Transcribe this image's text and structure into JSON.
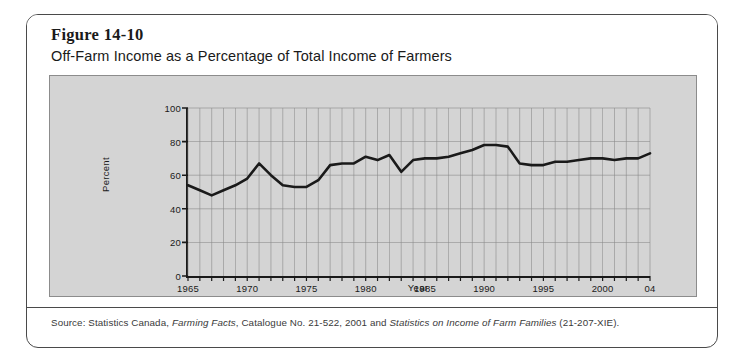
{
  "figure": {
    "number": "Figure 14-10",
    "title": "Off-Farm Income as a Percentage of Total Income of Farmers",
    "source_prefix": "Source: Statistics Canada, ",
    "source_italic_1": "Farming Facts",
    "source_middle": ", Catalogue No. 21-522, 2001 and ",
    "source_italic_2": "Statistics on Income of Farm Families",
    "source_suffix": " (21-207-XIE)."
  },
  "colors": {
    "panel_background": "#d4d4d4",
    "card_background": "#ffffff",
    "border": "#4a4a4a",
    "axis": "#1a1a1a",
    "grid": "#8a8a8a",
    "line": "#1a1a1a"
  },
  "chart_data": {
    "type": "line",
    "title": "Off-Farm Income as a Percentage of Total Income of Farmers",
    "xlabel": "Year",
    "ylabel": "Percent",
    "xlim": [
      1965,
      2004
    ],
    "ylim": [
      0,
      100
    ],
    "grid": true,
    "legend": "none",
    "y_ticks": [
      0,
      20,
      40,
      60,
      80,
      100
    ],
    "y_tick_labels": [
      "0",
      "20",
      "40",
      "60",
      "80",
      "100"
    ],
    "x_ticks": [
      1965,
      1970,
      1975,
      1980,
      1985,
      1990,
      1995,
      2000,
      2004
    ],
    "x_tick_labels": [
      "1965",
      "1970",
      "1975",
      "1980",
      "1985",
      "1990",
      "1995",
      "2000",
      "04"
    ],
    "x": [
      1965,
      1966,
      1967,
      1968,
      1969,
      1970,
      1971,
      1972,
      1973,
      1974,
      1975,
      1976,
      1977,
      1978,
      1979,
      1980,
      1981,
      1982,
      1983,
      1984,
      1985,
      1986,
      1987,
      1988,
      1989,
      1990,
      1991,
      1992,
      1993,
      1994,
      1995,
      1996,
      1997,
      1998,
      1999,
      2000,
      2001,
      2002,
      2003,
      2004
    ],
    "values": [
      54,
      51,
      48,
      51,
      54,
      58,
      67,
      60,
      54,
      53,
      53,
      57,
      66,
      67,
      67,
      71,
      69,
      72,
      62,
      69,
      70,
      70,
      71,
      73,
      75,
      78,
      78,
      77,
      67,
      66,
      66,
      68,
      68,
      69,
      70,
      70,
      69,
      70,
      70,
      73
    ],
    "series": [
      {
        "name": "Off-farm income as % of total income",
        "values": [
          54,
          51,
          48,
          51,
          54,
          58,
          67,
          60,
          54,
          53,
          53,
          57,
          66,
          67,
          67,
          71,
          69,
          72,
          62,
          69,
          70,
          70,
          71,
          73,
          75,
          78,
          78,
          77,
          67,
          66,
          66,
          68,
          68,
          69,
          70,
          70,
          69,
          70,
          70,
          73
        ]
      }
    ]
  }
}
